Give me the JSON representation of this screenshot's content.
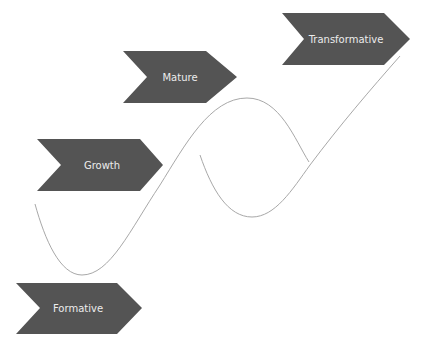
{
  "diagram": {
    "type": "maturity-stages",
    "colors": {
      "chevron_fill": "#545454",
      "label_text": "#ececec",
      "curve_stroke": "#a8a8a8",
      "background": "#ffffff"
    },
    "stages": [
      {
        "id": "formative",
        "label": "Formative"
      },
      {
        "id": "growth",
        "label": "Growth"
      },
      {
        "id": "mature",
        "label": "Mature"
      },
      {
        "id": "transformative",
        "label": "Transformative"
      }
    ]
  }
}
